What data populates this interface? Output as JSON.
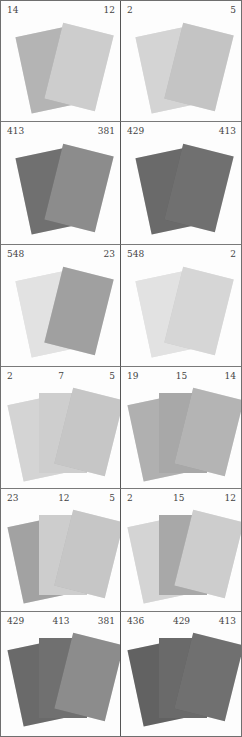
{
  "cells": [
    {
      "labels": [
        "14",
        "12"
      ],
      "cards": [
        "#b4b4b4",
        "#cdcdcd"
      ]
    },
    {
      "labels": [
        "2",
        "5"
      ],
      "cards": [
        "#d4d4d4",
        "#c4c4c4"
      ]
    },
    {
      "labels": [
        "413",
        "381"
      ],
      "cards": [
        "#707070",
        "#8c8c8c"
      ]
    },
    {
      "labels": [
        "429",
        "413"
      ],
      "cards": [
        "#6a6a6a",
        "#707070"
      ]
    },
    {
      "labels": [
        "548",
        "23"
      ],
      "cards": [
        "#e2e2e2",
        "#a0a0a0"
      ]
    },
    {
      "labels": [
        "548",
        "2"
      ],
      "cards": [
        "#e2e2e2",
        "#d6d6d6"
      ]
    },
    {
      "labels": [
        "2",
        "7",
        "5"
      ],
      "cards": [
        "#d4d4d4",
        "#cecece",
        "#c6c6c6"
      ]
    },
    {
      "labels": [
        "19",
        "15",
        "14"
      ],
      "cards": [
        "#b0b0b0",
        "#a8a8a8",
        "#b4b4b4"
      ]
    },
    {
      "labels": [
        "23",
        "12",
        "5"
      ],
      "cards": [
        "#a2a2a2",
        "#cdcdcd",
        "#c6c6c6"
      ]
    },
    {
      "labels": [
        "2",
        "15",
        "12"
      ],
      "cards": [
        "#d4d4d4",
        "#a8a8a8",
        "#cdcdcd"
      ]
    },
    {
      "labels": [
        "429",
        "413",
        "381"
      ],
      "cards": [
        "#6a6a6a",
        "#707070",
        "#8c8c8c"
      ]
    },
    {
      "labels": [
        "436",
        "429",
        "413"
      ],
      "cards": [
        "#626262",
        "#6a6a6a",
        "#707070"
      ]
    }
  ]
}
